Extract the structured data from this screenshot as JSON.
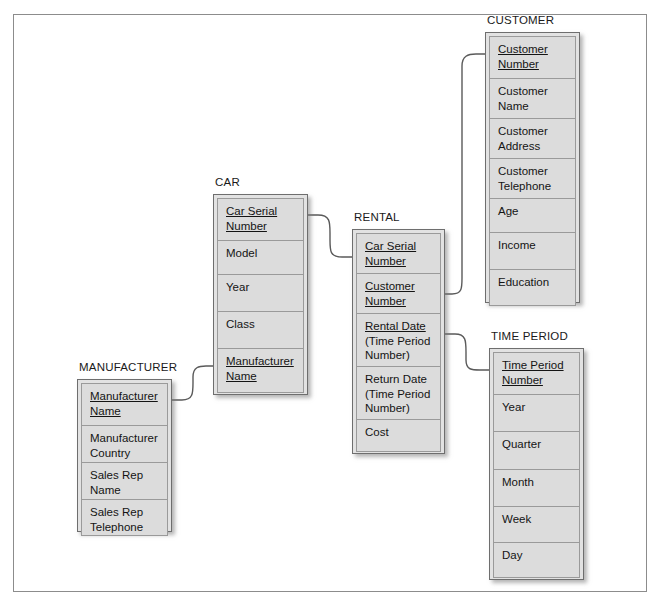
{
  "diagram": {
    "type": "entity-relationship-diagram",
    "entities": [
      {
        "id": "customer",
        "title": "CUSTOMER",
        "x": 485,
        "y": 32,
        "width": 95,
        "height": 271,
        "attributes": [
          {
            "lines": [
              "Customer",
              "Number"
            ],
            "key": true,
            "height": 42
          },
          {
            "lines": [
              "Customer",
              "Name"
            ],
            "key": false,
            "height": 40
          },
          {
            "lines": [
              "Customer",
              "Address"
            ],
            "key": false,
            "height": 40
          },
          {
            "lines": [
              "Customer",
              "Telephone"
            ],
            "key": false,
            "height": 40
          },
          {
            "lines": [
              "Age"
            ],
            "key": false,
            "height": 34
          },
          {
            "lines": [
              "Income"
            ],
            "key": false,
            "height": 37
          },
          {
            "lines": [
              "Education"
            ],
            "key": false,
            "height": 37
          }
        ]
      },
      {
        "id": "car",
        "title": "CAR",
        "x": 213,
        "y": 194,
        "width": 95,
        "height": 201,
        "attributes": [
          {
            "lines": [
              "Car Serial",
              "Number"
            ],
            "key": true,
            "height": 42
          },
          {
            "lines": [
              "Model"
            ],
            "key": false,
            "height": 34
          },
          {
            "lines": [
              "Year"
            ],
            "key": false,
            "height": 37
          },
          {
            "lines": [
              "Class"
            ],
            "key": false,
            "height": 37
          },
          {
            "lines": [
              "Manufacturer",
              "Name"
            ],
            "key": true,
            "height": 45
          }
        ]
      },
      {
        "id": "rental",
        "title": "RENTAL",
        "x": 352,
        "y": 229,
        "width": 93,
        "height": 225,
        "attributes": [
          {
            "lines": [
              "Car Serial",
              "Number"
            ],
            "key": true,
            "height": 40
          },
          {
            "lines": [
              "Customer",
              "Number"
            ],
            "key": true,
            "height": 40
          },
          {
            "lines": [
              "Rental Date",
              "(Time Period",
              "Number)"
            ],
            "key": true,
            "keyLines": 1,
            "height": 53
          },
          {
            "lines": [
              "Return Date",
              "(Time Period",
              "Number)"
            ],
            "key": false,
            "height": 53
          },
          {
            "lines": [
              "Cost"
            ],
            "key": false,
            "height": 33
          }
        ]
      },
      {
        "id": "time_period",
        "title": "TIME PERIOD",
        "x": 489,
        "y": 348,
        "width": 95,
        "height": 232,
        "attributes": [
          {
            "lines": [
              "Time Period",
              "Number"
            ],
            "key": true,
            "height": 42
          },
          {
            "lines": [
              "Year"
            ],
            "key": false,
            "height": 37
          },
          {
            "lines": [
              "Quarter"
            ],
            "key": false,
            "height": 38
          },
          {
            "lines": [
              "Month"
            ],
            "key": false,
            "height": 37
          },
          {
            "lines": [
              "Week"
            ],
            "key": false,
            "height": 36
          },
          {
            "lines": [
              "Day"
            ],
            "key": false,
            "height": 36
          }
        ]
      },
      {
        "id": "manufacturer",
        "title": "MANUFACTURER",
        "x": 77,
        "y": 379,
        "width": 95,
        "height": 153,
        "attributes": [
          {
            "lines": [
              "Manufacturer",
              "Name"
            ],
            "key": true,
            "height": 42
          },
          {
            "lines": [
              "Manufacturer",
              "Country"
            ],
            "key": false,
            "height": 37
          },
          {
            "lines": [
              "Sales Rep",
              "Name"
            ],
            "key": false,
            "height": 37
          },
          {
            "lines": [
              "Sales Rep",
              "Telephone"
            ],
            "key": false,
            "height": 37
          }
        ]
      }
    ],
    "relationships": [
      {
        "id": "car-rental",
        "from": "car",
        "to": "rental",
        "label": ""
      },
      {
        "id": "rental-customer",
        "from": "rental",
        "to": "customer",
        "label": ""
      },
      {
        "id": "rental-time-period",
        "from": "rental",
        "to": "time_period",
        "label": ""
      },
      {
        "id": "manufacturer-car",
        "from": "manufacturer",
        "to": "car",
        "label": ""
      }
    ],
    "colors": {
      "cell_fill": "#dcdcdc",
      "box_fill": "#e2e2e2",
      "border": "#6e6e6e",
      "cell_border": "#9a9a9a",
      "text": "#141414",
      "frame_border": "#8c8c8c",
      "connector": "#5a5a5a",
      "background": "#ffffff"
    }
  }
}
